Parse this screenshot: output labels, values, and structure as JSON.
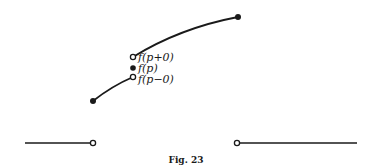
{
  "figure": {
    "caption": "Fig. 23",
    "labels": {
      "right_limit": "f(p+0)",
      "value": "f(p)",
      "left_limit": "f(p−0)"
    },
    "colors": {
      "ink": "#1a1a1a",
      "background": "#ffffff"
    }
  }
}
